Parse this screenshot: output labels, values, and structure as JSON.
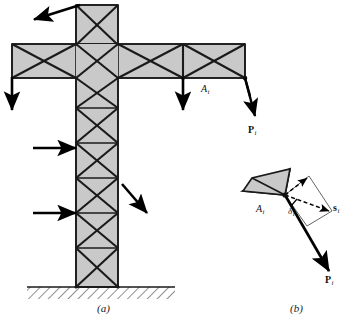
{
  "figure": {
    "colors": {
      "member_fill": "#c9c9c9",
      "member_stroke": "#1a1a1a",
      "brace_stroke": "#1a1a1a",
      "arrow": "#000000",
      "ground_hatch": "#333333",
      "background": "#ffffff"
    },
    "captions": [
      {
        "id": "caption-a",
        "text": "(a)",
        "x": 97,
        "y": 303
      },
      {
        "id": "caption-b",
        "text": "(b)",
        "x": 290,
        "y": 303
      }
    ]
  },
  "panel_a": {
    "name": "tower-truss-panel",
    "labels": [
      {
        "id": "label-Ai-a",
        "base": "A",
        "sub": "i",
        "bold": false,
        "x": 201,
        "y": 83
      },
      {
        "id": "label-Pi-a",
        "base": "P",
        "sub": "i",
        "bold": true,
        "x": 248,
        "y": 124
      }
    ],
    "arrows": [
      {
        "id": "arrow-top-left-diagonal",
        "x1": 80,
        "y1": 5,
        "x2": 32,
        "y2": 20
      },
      {
        "id": "arrow-left-down",
        "x1": 12,
        "y1": 77,
        "x2": 12,
        "y2": 112
      },
      {
        "id": "arrow-mid-down",
        "x1": 183,
        "y1": 77,
        "x2": 183,
        "y2": 112
      },
      {
        "id": "arrow-left-horizontal-upper",
        "x1": 33,
        "y1": 148,
        "x2": 79,
        "y2": 148
      },
      {
        "id": "arrow-left-horizontal-lower",
        "x1": 33,
        "y1": 213,
        "x2": 79,
        "y2": 213
      },
      {
        "id": "arrow-right-diagonal",
        "x1": 122,
        "y1": 184,
        "x2": 149,
        "y2": 216
      },
      {
        "id": "arrow-Pi-load",
        "x1": 212,
        "y1": 78,
        "x2": 256,
        "y2": 117
      }
    ],
    "ground": {
      "id": "ground-hatching",
      "x": 27,
      "y": 287,
      "width": 148,
      "height": 12
    }
  },
  "panel_b": {
    "name": "joint-displacement-detail",
    "labels": [
      {
        "id": "label-Ai-b",
        "base": "A",
        "sub": "i",
        "bold": false,
        "x": 258,
        "y": 206
      },
      {
        "id": "label-delta-i",
        "base": "δ",
        "sub": "i",
        "bold": false,
        "x": 288,
        "y": 208
      },
      {
        "id": "label-si",
        "base": "s",
        "sub": "i",
        "bold": true,
        "x": 334,
        "y": 203
      },
      {
        "id": "label-Pi-b",
        "base": "P",
        "sub": "i",
        "bold": true,
        "x": 326,
        "y": 277
      }
    ],
    "vectors": [
      {
        "id": "vector-Pi-b",
        "kind": "solid-arrow",
        "x1": 285,
        "y1": 195,
        "x2": 330,
        "y2": 272
      },
      {
        "id": "vector-si",
        "kind": "dashed-arrow",
        "x1": 285,
        "y1": 195,
        "x2": 330,
        "y2": 212
      },
      {
        "id": "vector-displacement",
        "kind": "dashed-arrow",
        "x1": 285,
        "y1": 195,
        "x2": 309,
        "y2": 176
      },
      {
        "id": "projection-marker",
        "kind": "tick",
        "x1": 292,
        "y1": 207,
        "x2": 297,
        "y2": 200
      }
    ]
  }
}
